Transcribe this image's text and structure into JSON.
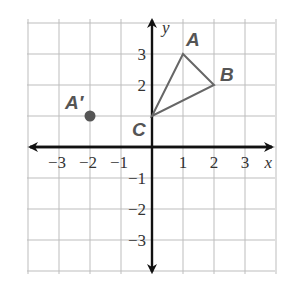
{
  "diagram": {
    "type": "coordinate-plane",
    "grid": {
      "xmin": -4,
      "xmax": 4,
      "ymin": -4,
      "ymax": 4,
      "color": "#bdbdbd"
    },
    "axes": {
      "x_label": "x",
      "y_label": "y",
      "x_ticks": [
        {
          "value": -3,
          "label": "−3"
        },
        {
          "value": -2,
          "label": "−2"
        },
        {
          "value": -1,
          "label": "−1"
        },
        {
          "value": 1,
          "label": "1"
        },
        {
          "value": 2,
          "label": "2"
        },
        {
          "value": 3,
          "label": "3"
        }
      ],
      "y_ticks": [
        {
          "value": 3,
          "label": "3"
        },
        {
          "value": 2,
          "label": "2"
        },
        {
          "value": -1,
          "label": "−1"
        },
        {
          "value": -2,
          "label": "−2"
        },
        {
          "value": -3,
          "label": "−3"
        }
      ],
      "color": "#111111"
    },
    "triangle": {
      "stroke": "#666666",
      "vertices": [
        {
          "name": "A",
          "label": "A",
          "x": 1,
          "y": 3
        },
        {
          "name": "B",
          "label": "B",
          "x": 2,
          "y": 2
        },
        {
          "name": "C",
          "label": "C",
          "x": 0,
          "y": 1
        }
      ]
    },
    "points": [
      {
        "name": "A-prime",
        "label": "A′",
        "x": -2,
        "y": 1,
        "color": "#555555"
      }
    ]
  }
}
